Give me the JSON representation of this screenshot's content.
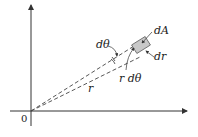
{
  "diagram": {
    "origin_label": "0",
    "labels": {
      "d_theta": "dθ",
      "dA": "dA",
      "dr": "dr",
      "r_d_theta": "r dθ",
      "r": "r"
    },
    "colors": {
      "axis": "#333333",
      "dashed": "#444444",
      "element_fill": "#c8c8c8",
      "element_stroke": "#666666"
    }
  }
}
